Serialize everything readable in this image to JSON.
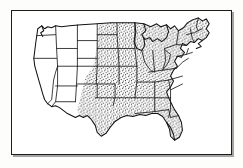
{
  "figure": {
    "subtitle": "",
    "caption": "",
    "style": "scanned black-and-white line drawing with stipple shading",
    "frame": {
      "visible": true,
      "border_color": "#1d1d1d",
      "shadow_color": "#282828",
      "background_color": "#ffffff"
    },
    "colors": {
      "outline": "#121212",
      "state_border": "#1a1a1a",
      "stipple_dot": "#1a1a1a",
      "shaded_region_fill": "#ffffff",
      "unshaded_region_fill": "#ffffff",
      "page_background": "#fdfdfc"
    },
    "legend": {
      "visible": false,
      "entries": [
        {
          "pattern": "stipple-dots",
          "meaning": "highlighted states"
        },
        {
          "pattern": "blank",
          "meaning": "states not highlighted"
        }
      ]
    },
    "regions": {
      "shaded_label": "stippled (dotted) states",
      "unshaded_label": "blank (unshaded) states",
      "shaded_states": [
        "Minnesota",
        "Iowa",
        "Missouri",
        "Arkansas",
        "Louisiana",
        "Texas",
        "Oklahoma",
        "Kansas",
        "Nebraska",
        "Wisconsin",
        "Illinois",
        "Michigan",
        "Indiana",
        "Ohio",
        "Kentucky",
        "Tennessee",
        "Mississippi",
        "Alabama",
        "Georgia",
        "Florida",
        "South Carolina",
        "North Carolina",
        "Virginia",
        "West Virginia",
        "Pennsylvania",
        "New York",
        "Vermont",
        "New Hampshire",
        "Maine",
        "Massachusetts",
        "Rhode Island",
        "Connecticut",
        "New Jersey",
        "Delaware",
        "Maryland"
      ],
      "unshaded_states": [
        "Washington",
        "Oregon",
        "California",
        "Nevada",
        "Idaho",
        "Montana",
        "Wyoming",
        "Utah",
        "Arizona",
        "Colorado",
        "New Mexico",
        "North Dakota",
        "South Dakota"
      ]
    },
    "counts": {
      "shaded": 35,
      "unshaded": 13,
      "total": 48
    }
  }
}
